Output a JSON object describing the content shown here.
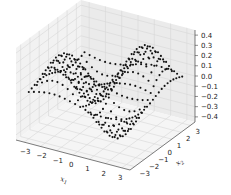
{
  "chart_data": {
    "type": "scatter3d",
    "title": "",
    "xlabel": "x1",
    "ylabel": "x2",
    "zlabel": "",
    "xlim": [
      -3.5,
      3.5
    ],
    "ylim": [
      -3.5,
      3.5
    ],
    "zlim": [
      -0.45,
      0.45
    ],
    "xticks": [
      "−3",
      "−2",
      "−1",
      "0",
      "1",
      "2",
      "3"
    ],
    "yticks": [
      "−3",
      "−2",
      "−1",
      "0",
      "1",
      "2",
      "3"
    ],
    "zticks": [
      "−0.4",
      "−0.3",
      "−0.2",
      "−0.1",
      "0.0",
      "0.1",
      "0.2",
      "0.3",
      "0.4"
    ],
    "grid": true,
    "marker": "dot",
    "marker_color": "#111111",
    "surface_description": "grid of points x1,x2 in [-3,3], z ≈ 0.3·sin(x1)·sin(x2)-like saddle surface ranging about -0.4 to 0.4",
    "grid_points_per_axis": 20,
    "z_amplitude": 0.38
  },
  "colors": {
    "pane_left": "#f2f2f2",
    "pane_right": "#ebebeb",
    "pane_floor": "#f5f5f5",
    "grid": "#d6d6d6",
    "axis": "#444444",
    "points": "#111111"
  }
}
